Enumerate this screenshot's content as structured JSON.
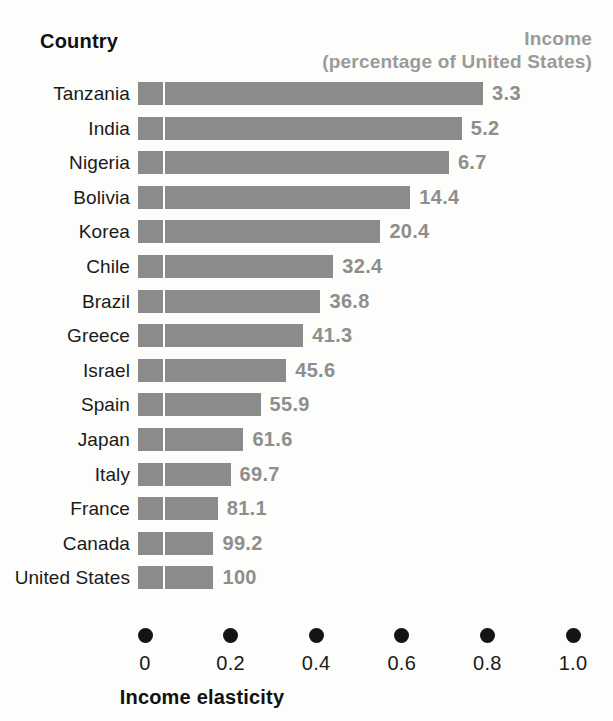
{
  "header": {
    "country_label": "Country",
    "income_label": "Income",
    "income_sub_label": "(percentage of United States)"
  },
  "axis": {
    "title": "Income elasticity",
    "ticks": [
      "0",
      "0.2",
      "0.4",
      "0.6",
      "0.8",
      "1.0"
    ]
  },
  "colors": {
    "bar": "#8b8b8b",
    "value_text": "#8e8e8e",
    "header_income": "#9a9a9a",
    "label_text": "#1a1a1a",
    "dot": "#141414",
    "background": "#fdfdfb"
  },
  "chart_data": {
    "type": "bar",
    "orientation": "horizontal",
    "title": "",
    "xlabel": "Income elasticity",
    "ylabel": "Country",
    "xlim": [
      0,
      1.0
    ],
    "xticks": [
      0,
      0.2,
      0.4,
      0.6,
      0.8,
      1.0
    ],
    "grid": false,
    "legend": null,
    "categories": [
      "Tanzania",
      "India",
      "Nigeria",
      "Bolivia",
      "Korea",
      "Chile",
      "Brazil",
      "Greece",
      "Israel",
      "Spain",
      "Japan",
      "Italy",
      "France",
      "Canada",
      "United States"
    ],
    "series": [
      {
        "name": "Income elasticity",
        "values": [
          0.79,
          0.74,
          0.71,
          0.62,
          0.55,
          0.44,
          0.41,
          0.37,
          0.33,
          0.27,
          0.23,
          0.2,
          0.17,
          0.16,
          0.16
        ]
      }
    ],
    "data_labels": {
      "name": "Income (percentage of United States)",
      "values": [
        "3.3",
        "5.2",
        "6.7",
        "14.4",
        "20.4",
        "32.4",
        "36.8",
        "41.3",
        "45.6",
        "55.9",
        "61.6",
        "69.7",
        "81.1",
        "99.2",
        "100"
      ]
    },
    "rows": [
      {
        "country": "Tanzania",
        "income_pct": "3.3",
        "elasticity": 0.79
      },
      {
        "country": "India",
        "income_pct": "5.2",
        "elasticity": 0.74
      },
      {
        "country": "Nigeria",
        "income_pct": "6.7",
        "elasticity": 0.71
      },
      {
        "country": "Bolivia",
        "income_pct": "14.4",
        "elasticity": 0.62
      },
      {
        "country": "Korea",
        "income_pct": "20.4",
        "elasticity": 0.55
      },
      {
        "country": "Chile",
        "income_pct": "32.4",
        "elasticity": 0.44
      },
      {
        "country": "Brazil",
        "income_pct": "36.8",
        "elasticity": 0.41
      },
      {
        "country": "Greece",
        "income_pct": "41.3",
        "elasticity": 0.37
      },
      {
        "country": "Israel",
        "income_pct": "45.6",
        "elasticity": 0.33
      },
      {
        "country": "Spain",
        "income_pct": "55.9",
        "elasticity": 0.27
      },
      {
        "country": "Japan",
        "income_pct": "61.6",
        "elasticity": 0.23
      },
      {
        "country": "Italy",
        "income_pct": "69.7",
        "elasticity": 0.2
      },
      {
        "country": "France",
        "income_pct": "81.1",
        "elasticity": 0.17
      },
      {
        "country": "Canada",
        "income_pct": "99.2",
        "elasticity": 0.16
      },
      {
        "country": "United States",
        "income_pct": "100",
        "elasticity": 0.16
      }
    ]
  }
}
